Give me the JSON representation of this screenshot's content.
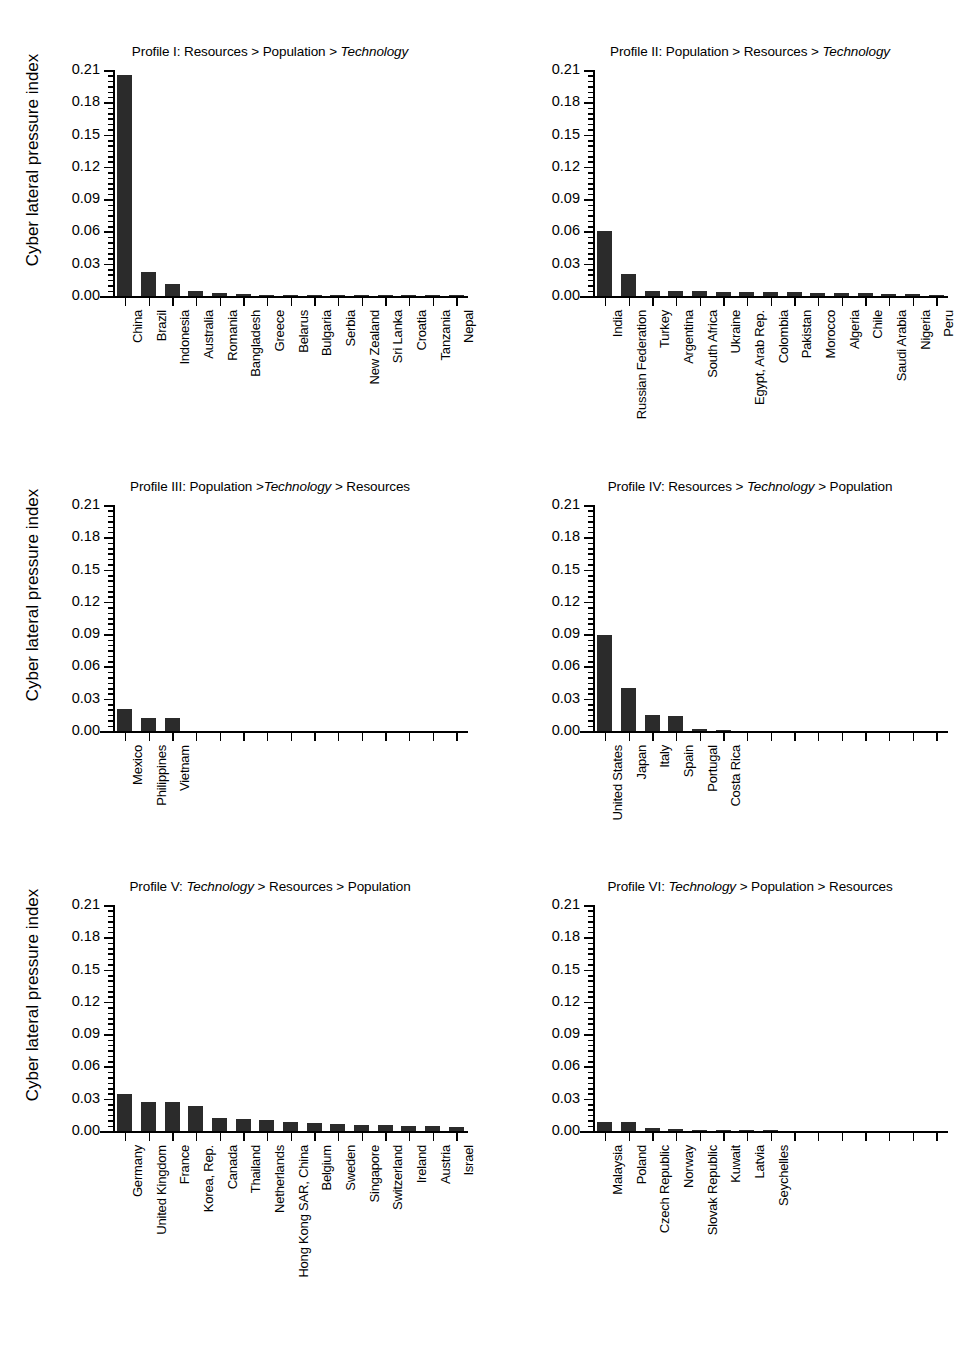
{
  "figure": {
    "y_axis_label": "Cyber lateral pressure index",
    "y_ticks": [
      "0.00",
      "0.03",
      "0.06",
      "0.09",
      "0.12",
      "0.15",
      "0.18",
      "0.21"
    ],
    "bar_color": "#2b2b2b",
    "axis_color": "#000000",
    "background": "#ffffff",
    "n_tick_slots": 15
  },
  "chart_data": [
    {
      "type": "bar",
      "panel": "I",
      "title_prefix": "Profile I: Resources > Population > ",
      "title_italic": "Technology",
      "title": "Profile I: Resources > Population > Technology",
      "ylabel": "Cyber lateral pressure index",
      "xlabel": "",
      "ylim": [
        0.0,
        0.21
      ],
      "ytick_values": [
        0.0,
        0.03,
        0.06,
        0.09,
        0.12,
        0.15,
        0.18,
        0.21
      ],
      "grid": false,
      "legend": "none",
      "categories": [
        "China",
        "Brazil",
        "Indonesia",
        "Australia",
        "Romania",
        "Bangladesh",
        "Greece",
        "Belarus",
        "Bulgaria",
        "Serbia",
        "New Zealand",
        "Sri Lanka",
        "Croatia",
        "Tanzania",
        "Nepal"
      ],
      "values": [
        0.2055,
        0.0225,
        0.0115,
        0.005,
        0.0032,
        0.0018,
        0.0014,
        0.0011,
        0.0009,
        0.0007,
        0.0006,
        0.0005,
        0.0004,
        0.0003,
        0.0002
      ]
    },
    {
      "type": "bar",
      "panel": "II",
      "title_prefix": "Profile II: Population > Resources > ",
      "title_italic": "Technology",
      "title": "Profile II: Population > Resources > Technology",
      "ylabel": "",
      "xlabel": "",
      "ylim": [
        0.0,
        0.21
      ],
      "ytick_values": [
        0.0,
        0.03,
        0.06,
        0.09,
        0.12,
        0.15,
        0.18,
        0.21
      ],
      "grid": false,
      "legend": "none",
      "categories": [
        "India",
        "Russian Federation",
        "Turkey",
        "Argentina",
        "South Africa",
        "Ukraine",
        "Egypt, Arab Rep.",
        "Colombia",
        "Pakistan",
        "Morocco",
        "Algeria",
        "Chile",
        "Saudi Arabia",
        "Nigeria",
        "Peru"
      ],
      "values": [
        0.0605,
        0.02,
        0.0048,
        0.0045,
        0.0042,
        0.004,
        0.0038,
        0.0035,
        0.0033,
        0.003,
        0.0028,
        0.0025,
        0.0022,
        0.0017,
        0.001
      ]
    },
    {
      "type": "bar",
      "panel": "III",
      "title_prefix": "Profile III: Population >",
      "title_italic": "Technology",
      "title": "Profile III: Population >Technology > Resources",
      "title_suffix": " > Resources",
      "ylabel": "Cyber lateral pressure index",
      "xlabel": "",
      "ylim": [
        0.0,
        0.21
      ],
      "ytick_values": [
        0.0,
        0.03,
        0.06,
        0.09,
        0.12,
        0.15,
        0.18,
        0.21
      ],
      "grid": false,
      "legend": "none",
      "categories": [
        "Mexico",
        "Philippines",
        "Vietnam"
      ],
      "values": [
        0.0205,
        0.0123,
        0.012
      ]
    },
    {
      "type": "bar",
      "panel": "IV",
      "title_prefix": "Profile IV: Resources > ",
      "title_italic": "Technology",
      "title": "Profile IV: Resources > Technology > Population",
      "title_suffix": " > Population",
      "ylabel": "",
      "xlabel": "",
      "ylim": [
        0.0,
        0.21
      ],
      "ytick_values": [
        0.0,
        0.03,
        0.06,
        0.09,
        0.12,
        0.15,
        0.18,
        0.21
      ],
      "grid": false,
      "legend": "none",
      "categories": [
        "United States",
        "Japan",
        "Italy",
        "Spain",
        "Portugal",
        "Costa Rica"
      ],
      "values": [
        0.089,
        0.04,
        0.0145,
        0.0135,
        0.002,
        0.0005
      ]
    },
    {
      "type": "bar",
      "panel": "V",
      "title_prefix": "Profile V: ",
      "title_italic": "Technology",
      "title": "Profile V: Technology > Resources > Population",
      "title_suffix": " > Resources > Population",
      "ylabel": "Cyber lateral pressure index",
      "xlabel": "",
      "ylim": [
        0.0,
        0.21
      ],
      "ytick_values": [
        0.0,
        0.03,
        0.06,
        0.09,
        0.12,
        0.15,
        0.18,
        0.21
      ],
      "grid": false,
      "legend": "none",
      "categories": [
        "Germany",
        "United Kingdom",
        "France",
        "Korea, Rep.",
        "Canada",
        "Thailand",
        "Netherlands",
        "Hong Kong SAR, China",
        "Belgium",
        "Sweden",
        "Singapore",
        "Switzerland",
        "Ireland",
        "Austria",
        "Israel"
      ],
      "values": [
        0.034,
        0.0268,
        0.0265,
        0.0228,
        0.012,
        0.0112,
        0.0105,
        0.0082,
        0.007,
        0.0062,
        0.006,
        0.0052,
        0.0048,
        0.0044,
        0.004
      ]
    },
    {
      "type": "bar",
      "panel": "VI",
      "title_prefix": "Profile VI: ",
      "title_italic": "Technology",
      "title": "Profile VI: Technology > Population > Resources",
      "title_suffix": " > Population > Resources",
      "ylabel": "",
      "xlabel": "",
      "ylim": [
        0.0,
        0.21
      ],
      "ytick_values": [
        0.0,
        0.03,
        0.06,
        0.09,
        0.12,
        0.15,
        0.18,
        0.21
      ],
      "grid": false,
      "legend": "none",
      "categories": [
        "Malaysia",
        "Poland",
        "Czech Republic",
        "Norway",
        "Slovak Republic",
        "Kuwait",
        "Latvia",
        "Seychelles"
      ],
      "values": [
        0.0082,
        0.008,
        0.003,
        0.0018,
        0.0014,
        0.0004,
        0.0002,
        0.0001
      ]
    }
  ]
}
